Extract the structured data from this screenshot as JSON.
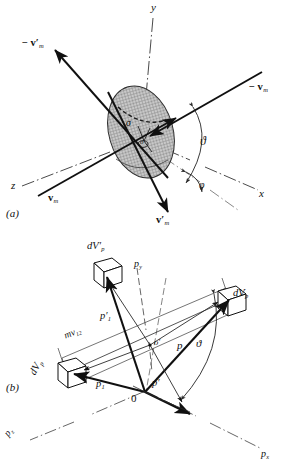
{
  "figure": {
    "panels": [
      {
        "id": "a",
        "label": "(a)",
        "caption": "Velocity vectors, collision cross section and scattering angles"
      },
      {
        "id": "b",
        "label": "(b)",
        "caption": "Momentum vectors and volume elements in momentum space"
      }
    ],
    "colors": {
      "ink": "#101010",
      "hatch": "#8a8a8a",
      "ellipse_fill": "#c9c9c9",
      "dash_axis": "#555555",
      "thin_line": "#3a3a3a"
    }
  },
  "panel_a": {
    "label": "(a)",
    "axes": [
      {
        "name": "axis-y",
        "label": "y"
      },
      {
        "name": "axis-x",
        "label": "x"
      },
      {
        "name": "axis-z",
        "label": "z"
      }
    ],
    "vectors": [
      {
        "name": "vector-minus-v-m-prime-upper",
        "text": "− v′",
        "sub": "m",
        "base": "− v′m"
      },
      {
        "name": "vector-minus-v-m-upper-right",
        "text": "− v",
        "sub": "m",
        "base": "− vm"
      },
      {
        "name": "vector-v-m-lower-left",
        "text": "v",
        "sub": "m",
        "base": "vm"
      },
      {
        "name": "vector-v-m-prime-lower",
        "text": "v′",
        "sub": "m",
        "base": "v′m"
      }
    ],
    "angles": [
      {
        "name": "angle-theta",
        "label": "ϑ"
      },
      {
        "name": "angle-phi",
        "label": "φ"
      }
    ],
    "cross_section": {
      "name": "cross-section-sigma",
      "label": "σ"
    },
    "origin_marker": {
      "name": "origin-o",
      "label": "o"
    }
  },
  "panel_b": {
    "label": "(b)",
    "axes": [
      {
        "name": "axis-p-y",
        "label": "p",
        "sub": "y"
      },
      {
        "name": "axis-p-x",
        "label": "p",
        "sub": "x"
      },
      {
        "name": "axis-p-z",
        "label": "p",
        "sub": "z"
      }
    ],
    "volume_elements": [
      {
        "name": "volume-element-dVp-prime-top",
        "label": "dV′",
        "sub": "p"
      },
      {
        "name": "volume-element-dVp-right",
        "label": "dV",
        "sub": "p"
      },
      {
        "name": "volume-element-dVp-left",
        "label": "dV",
        "sub": "p"
      }
    ],
    "vectors": [
      {
        "name": "vector-p",
        "label": "p",
        "sub": ""
      },
      {
        "name": "vector-p-prime",
        "label": "p′",
        "sub": ""
      },
      {
        "name": "vector-p-1",
        "label": "p",
        "sub": "1"
      },
      {
        "name": "vector-p-1-prime",
        "label": "p′",
        "sub": "1"
      }
    ],
    "angles": [
      {
        "name": "angle-theta-b",
        "label": "ϑ"
      }
    ],
    "points": [
      {
        "name": "origin-0",
        "label": "0"
      },
      {
        "name": "midpoint-o-prime",
        "label": "o′"
      }
    ],
    "separation_label": {
      "name": "separation-mv12",
      "label": "mv",
      "sub": "12"
    }
  }
}
